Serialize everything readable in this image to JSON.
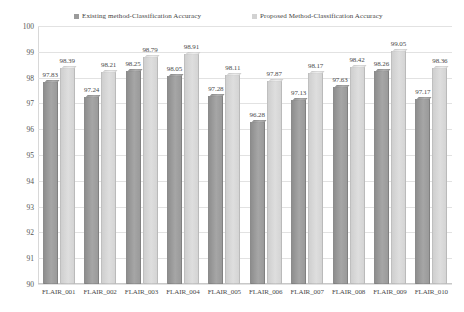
{
  "chart_data": {
    "type": "bar",
    "title": "",
    "xlabel": "",
    "ylabel": "",
    "ylim": [
      90,
      100
    ],
    "ystep": 1,
    "grid": true,
    "legend_position": "top",
    "categories": [
      "FLAIR_001",
      "FLAIR_002",
      "FLAIR_003",
      "FLAIR_004",
      "FLAIR_005",
      "FLAIR_006",
      "FLAIR_007",
      "FLAIR_008",
      "FLAIR_009",
      "FLAIR_010"
    ],
    "yticks": [
      "100",
      "99",
      "98",
      "97",
      "96",
      "95",
      "94",
      "93",
      "92",
      "91",
      "90"
    ],
    "series": [
      {
        "name": "Existing method-Classification Accuracy",
        "color": "#9b9b9b",
        "values": [
          97.83,
          97.24,
          98.25,
          98.05,
          97.28,
          96.28,
          97.13,
          97.63,
          98.26,
          97.17
        ],
        "labels": [
          "97.83",
          "97.24",
          "98.25",
          "98.05",
          "97.28",
          "96.28",
          "97.13",
          "97.63",
          "98.26",
          "97.17"
        ]
      },
      {
        "name": "Proposed Method-Classification Accuracy",
        "color": "#d2d2d2",
        "values": [
          98.39,
          98.21,
          98.79,
          98.91,
          98.11,
          97.87,
          98.17,
          98.42,
          99.05,
          98.36
        ],
        "labels": [
          "98.39",
          "98.21",
          "98.79",
          "98.91",
          "98.11",
          "97.87",
          "98.17",
          "98.42",
          "99.05",
          "98.36"
        ]
      }
    ]
  },
  "legend": {
    "entries": [
      {
        "label": "Existing method-Classification Accuracy",
        "swatch": "existing-series-swatch"
      },
      {
        "label": "Proposed Method-Classification Accuracy",
        "swatch": "proposed-series-swatch"
      }
    ]
  }
}
